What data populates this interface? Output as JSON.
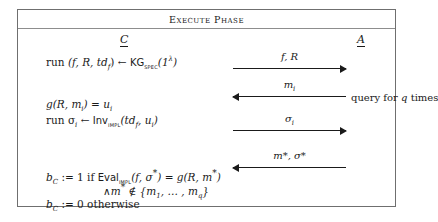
{
  "figure": {
    "title": "Execute Phase",
    "parties": {
      "left": "C",
      "right": "A"
    },
    "left_column": {
      "line1_run": "run",
      "line1_tuple": "(f, R, td",
      "line1_tuple_sub": "f",
      "line1_tuple_close": ") ← ",
      "line1_kg": "KG",
      "line1_kg_sub": "spec",
      "line1_kg_arg": "(1",
      "line1_kg_exp": "λ",
      "line1_kg_end": ")",
      "line2": "g(R, m",
      "line2_sub": "i",
      "line2_eq": ") = u",
      "line2_sub2": "i",
      "line3_run": "run σ",
      "line3_sub": "i",
      "line3_arrow": " ← ",
      "line3_inv": "Inv",
      "line3_inv_sub": "impl",
      "line3_args": "(td",
      "line3_args_sub": "f",
      "line3_args_rest": ", u",
      "line3_args_sub2": "i",
      "line3_args_close": ")",
      "line4_b": "b",
      "line4_b_sub": "C",
      "line4_assign": " := 1 if ",
      "line4_eval": "Eval",
      "line4_eval_sub": "impl",
      "line4_eval_args": "(f, σ",
      "line4_star1": "*",
      "line4_mid": ") = g(R, m",
      "line4_star2": "*",
      "line4_end": ")",
      "line5_and": "∧m",
      "line5_star": "*",
      "line5_notin": " ∉ {m",
      "line5_sub1": "1",
      "line5_dots": ", … , m",
      "line5_subq": "q",
      "line5_close": "}",
      "line6_b": "b",
      "line6_b_sub": "C",
      "line6_rest": " := 0 otherwise"
    },
    "messages": [
      {
        "label": "f, R",
        "direction": "right"
      },
      {
        "label": "m",
        "label_sub": "i",
        "direction": "left",
        "note": "query for q times"
      },
      {
        "label": "σ",
        "label_sub": "i",
        "direction": "right"
      },
      {
        "label": "m*, σ*",
        "direction": "left"
      }
    ],
    "note_right": "query for q times"
  }
}
